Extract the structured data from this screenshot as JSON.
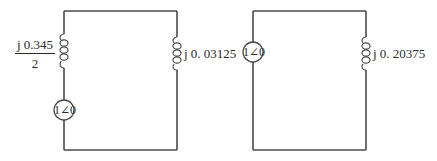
{
  "circuits": [
    {
      "id": "circuit-1",
      "left_inductor": {
        "numerator": "j 0.345",
        "denominator": "2"
      },
      "source": {
        "label": "1∠0"
      },
      "right_inductor": {
        "label": "j 0. 03125"
      }
    },
    {
      "id": "circuit-2",
      "source": {
        "label": "1∠0"
      },
      "right_inductor": {
        "label": "j 0. 20375"
      }
    }
  ],
  "colors": {
    "wire": "#4a4a4a",
    "text": "#2a2a2a",
    "background": "#ffffff"
  }
}
